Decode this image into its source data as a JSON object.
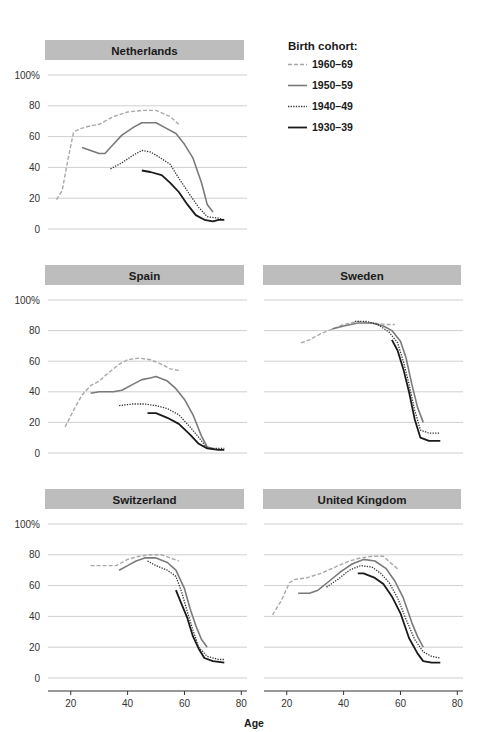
{
  "chart_data": {
    "type": "line",
    "title": "",
    "xlabel": "Age",
    "ylabel": "",
    "xlim": [
      12,
      82
    ],
    "ylim": [
      0,
      100
    ],
    "x_ticks": [
      20,
      40,
      60,
      80
    ],
    "y_ticks": [
      0,
      20,
      40,
      60,
      80,
      100
    ],
    "y_tick_labels": [
      "0",
      "20",
      "40",
      "60",
      "80",
      "100%"
    ],
    "grid": true,
    "legend": {
      "title": "Birth cohort:",
      "position": "top-right",
      "entries": [
        {
          "label": "1960–69",
          "style": "dashed",
          "color": "#a8a8a8"
        },
        {
          "label": "1950–59",
          "style": "solid",
          "color": "#7a7a7a"
        },
        {
          "label": "1940–49",
          "style": "dotted",
          "color": "#333333"
        },
        {
          "label": "1930–39",
          "style": "solid",
          "color": "#1a1a1a"
        }
      ]
    },
    "panels": [
      {
        "title": "Netherlands",
        "series": [
          {
            "name": "1960–69",
            "points": [
              [
                15,
                19
              ],
              [
                17,
                25
              ],
              [
                19,
                45
              ],
              [
                21,
                63
              ],
              [
                23,
                65
              ],
              [
                27,
                67
              ],
              [
                30,
                68
              ],
              [
                35,
                73
              ],
              [
                40,
                76
              ],
              [
                45,
                77
              ],
              [
                50,
                77
              ],
              [
                55,
                73
              ],
              [
                58,
                68
              ]
            ]
          },
          {
            "name": "1950–59",
            "points": [
              [
                24,
                53
              ],
              [
                27,
                51
              ],
              [
                30,
                49
              ],
              [
                32,
                49
              ],
              [
                35,
                55
              ],
              [
                38,
                61
              ],
              [
                42,
                66
              ],
              [
                45,
                69
              ],
              [
                50,
                69
              ],
              [
                53,
                66
              ],
              [
                57,
                62
              ],
              [
                60,
                55
              ],
              [
                63,
                46
              ],
              [
                66,
                30
              ],
              [
                68,
                16
              ],
              [
                70,
                11
              ]
            ]
          },
          {
            "name": "1940–49",
            "points": [
              [
                34,
                39
              ],
              [
                38,
                43
              ],
              [
                42,
                48
              ],
              [
                45,
                51
              ],
              [
                48,
                50
              ],
              [
                50,
                48
              ],
              [
                55,
                42
              ],
              [
                58,
                33
              ],
              [
                62,
                22
              ],
              [
                65,
                14
              ],
              [
                68,
                8
              ],
              [
                72,
                7
              ],
              [
                74,
                6
              ]
            ]
          },
          {
            "name": "1930–39",
            "points": [
              [
                45,
                38
              ],
              [
                48,
                37
              ],
              [
                52,
                35
              ],
              [
                55,
                30
              ],
              [
                58,
                24
              ],
              [
                61,
                16
              ],
              [
                64,
                9
              ],
              [
                67,
                6
              ],
              [
                70,
                5
              ],
              [
                72,
                6
              ],
              [
                74,
                6
              ]
            ]
          }
        ]
      },
      {
        "title": "Spain",
        "series": [
          {
            "name": "1960–69",
            "points": [
              [
                18,
                17
              ],
              [
                21,
                28
              ],
              [
                24,
                38
              ],
              [
                27,
                44
              ],
              [
                30,
                47
              ],
              [
                33,
                52
              ],
              [
                37,
                58
              ],
              [
                40,
                61
              ],
              [
                44,
                62
              ],
              [
                48,
                61
              ],
              [
                52,
                58
              ],
              [
                55,
                55
              ],
              [
                58,
                54
              ]
            ]
          },
          {
            "name": "1950–59",
            "points": [
              [
                27,
                39
              ],
              [
                30,
                40
              ],
              [
                35,
                40
              ],
              [
                38,
                41
              ],
              [
                42,
                45
              ],
              [
                45,
                48
              ],
              [
                48,
                49
              ],
              [
                50,
                50
              ],
              [
                54,
                47
              ],
              [
                57,
                42
              ],
              [
                60,
                35
              ],
              [
                63,
                25
              ],
              [
                66,
                11
              ],
              [
                68,
                4
              ],
              [
                70,
                3
              ]
            ]
          },
          {
            "name": "1940–49",
            "points": [
              [
                37,
                31
              ],
              [
                42,
                32
              ],
              [
                46,
                32
              ],
              [
                50,
                31
              ],
              [
                54,
                29
              ],
              [
                58,
                25
              ],
              [
                62,
                17
              ],
              [
                66,
                8
              ],
              [
                68,
                3
              ],
              [
                72,
                3
              ],
              [
                74,
                3
              ]
            ]
          },
          {
            "name": "1930–39",
            "points": [
              [
                47,
                26
              ],
              [
                50,
                26
              ],
              [
                54,
                23
              ],
              [
                58,
                19
              ],
              [
                62,
                12
              ],
              [
                65,
                6
              ],
              [
                68,
                3
              ],
              [
                72,
                2
              ],
              [
                74,
                2
              ]
            ]
          }
        ]
      },
      {
        "title": "Sweden",
        "series": [
          {
            "name": "1960–69",
            "points": [
              [
                25,
                72
              ],
              [
                28,
                74
              ],
              [
                32,
                78
              ],
              [
                36,
                81
              ],
              [
                40,
                84
              ],
              [
                45,
                86
              ],
              [
                50,
                85
              ],
              [
                55,
                84
              ],
              [
                58,
                84
              ]
            ]
          },
          {
            "name": "1950–59",
            "points": [
              [
                36,
                81
              ],
              [
                40,
                83
              ],
              [
                45,
                85
              ],
              [
                50,
                85
              ],
              [
                54,
                83
              ],
              [
                57,
                80
              ],
              [
                60,
                73
              ],
              [
                62,
                62
              ],
              [
                64,
                45
              ],
              [
                66,
                30
              ],
              [
                68,
                20
              ]
            ]
          },
          {
            "name": "1940–49",
            "points": [
              [
                44,
                86
              ],
              [
                48,
                86
              ],
              [
                52,
                84
              ],
              [
                56,
                79
              ],
              [
                59,
                72
              ],
              [
                61,
                60
              ],
              [
                63,
                45
              ],
              [
                65,
                28
              ],
              [
                67,
                15
              ],
              [
                70,
                13
              ],
              [
                74,
                13
              ]
            ]
          },
          {
            "name": "1930–39",
            "points": [
              [
                57,
                74
              ],
              [
                59,
                67
              ],
              [
                61,
                55
              ],
              [
                63,
                40
              ],
              [
                65,
                22
              ],
              [
                67,
                10
              ],
              [
                70,
                8
              ],
              [
                74,
                8
              ]
            ]
          }
        ]
      },
      {
        "title": "Switzerland",
        "series": [
          {
            "name": "1960–69",
            "points": [
              [
                27,
                73
              ],
              [
                32,
                73
              ],
              [
                36,
                73
              ],
              [
                40,
                77
              ],
              [
                44,
                79
              ],
              [
                48,
                80
              ],
              [
                52,
                80
              ],
              [
                55,
                78
              ],
              [
                58,
                76
              ]
            ]
          },
          {
            "name": "1950–59",
            "points": [
              [
                37,
                70
              ],
              [
                40,
                73
              ],
              [
                43,
                76
              ],
              [
                46,
                78
              ],
              [
                50,
                78
              ],
              [
                54,
                75
              ],
              [
                57,
                70
              ],
              [
                60,
                58
              ],
              [
                62,
                45
              ],
              [
                64,
                34
              ],
              [
                66,
                25
              ],
              [
                68,
                20
              ]
            ]
          },
          {
            "name": "1940–49",
            "points": [
              [
                47,
                76
              ],
              [
                50,
                73
              ],
              [
                54,
                70
              ],
              [
                57,
                66
              ],
              [
                59,
                56
              ],
              [
                61,
                43
              ],
              [
                63,
                31
              ],
              [
                65,
                20
              ],
              [
                68,
                14
              ],
              [
                72,
                12
              ],
              [
                74,
                12
              ]
            ]
          },
          {
            "name": "1930–39",
            "points": [
              [
                57,
                57
              ],
              [
                59,
                48
              ],
              [
                61,
                39
              ],
              [
                63,
                27
              ],
              [
                65,
                19
              ],
              [
                67,
                13
              ],
              [
                70,
                11
              ],
              [
                74,
                10
              ]
            ]
          }
        ]
      },
      {
        "title": "United Kingdom",
        "series": [
          {
            "name": "1960–69",
            "points": [
              [
                15,
                41
              ],
              [
                18,
                50
              ],
              [
                21,
                62
              ],
              [
                23,
                64
              ],
              [
                27,
                65
              ],
              [
                32,
                68
              ],
              [
                37,
                72
              ],
              [
                42,
                76
              ],
              [
                46,
                78
              ],
              [
                50,
                79
              ],
              [
                54,
                79
              ],
              [
                57,
                74
              ],
              [
                59,
                71
              ]
            ]
          },
          {
            "name": "1950–59",
            "points": [
              [
                24,
                55
              ],
              [
                28,
                55
              ],
              [
                31,
                57
              ],
              [
                35,
                63
              ],
              [
                39,
                69
              ],
              [
                43,
                74
              ],
              [
                47,
                77
              ],
              [
                51,
                76
              ],
              [
                55,
                71
              ],
              [
                58,
                63
              ],
              [
                61,
                52
              ],
              [
                64,
                36
              ],
              [
                66,
                27
              ],
              [
                68,
                20
              ]
            ]
          },
          {
            "name": "1940–49",
            "points": [
              [
                34,
                59
              ],
              [
                38,
                64
              ],
              [
                42,
                70
              ],
              [
                46,
                73
              ],
              [
                50,
                72
              ],
              [
                53,
                68
              ],
              [
                56,
                62
              ],
              [
                59,
                52
              ],
              [
                62,
                38
              ],
              [
                65,
                25
              ],
              [
                68,
                17
              ],
              [
                71,
                14
              ],
              [
                74,
                13
              ]
            ]
          },
          {
            "name": "1930–39",
            "points": [
              [
                45,
                68
              ],
              [
                47,
                68
              ],
              [
                51,
                65
              ],
              [
                54,
                61
              ],
              [
                57,
                53
              ],
              [
                60,
                42
              ],
              [
                63,
                26
              ],
              [
                66,
                16
              ],
              [
                68,
                11
              ],
              [
                71,
                10
              ],
              [
                74,
                10
              ]
            ]
          }
        ]
      }
    ]
  },
  "colors": {
    "title_bar": "#bdbdbd",
    "gridline": "#cfcfcf",
    "axis": "#333333"
  }
}
